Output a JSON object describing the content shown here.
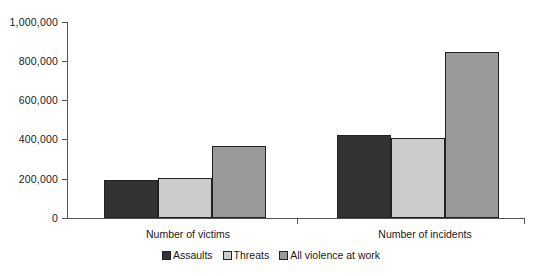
{
  "chart_data": {
    "type": "bar",
    "title": "",
    "subtitle": "",
    "xlabel": "",
    "ylabel": "",
    "categories": [
      "Number of victims",
      "Number of incidents"
    ],
    "series": [
      {
        "name": "Assaults",
        "color": "#333333",
        "values": [
          194000,
          425000
        ]
      },
      {
        "name": "Threats",
        "color": "#cccccc",
        "values": [
          204000,
          410000
        ]
      },
      {
        "name": "All violence at work",
        "color": "#999999",
        "values": [
          367000,
          845000
        ]
      }
    ],
    "ylim": [
      0,
      1000000
    ],
    "ytick_values": [
      0,
      200000,
      400000,
      600000,
      800000,
      1000000
    ],
    "ytick_labels": [
      "0",
      "200,000",
      "400,000",
      "600,000",
      "800,000",
      "1,000,000"
    ],
    "grid": false,
    "legend_position": "bottom",
    "annotations": []
  },
  "axis": {
    "line_color": "#555555"
  },
  "legend": {
    "items": [
      {
        "label": "Assaults",
        "color": "#333333"
      },
      {
        "label": "Threats",
        "color": "#cccccc"
      },
      {
        "label": "All violence at work",
        "color": "#999999"
      }
    ]
  }
}
